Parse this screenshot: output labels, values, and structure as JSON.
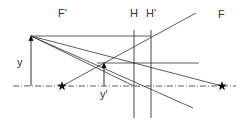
{
  "diagram": {
    "labels": {
      "focal_front": "F'",
      "principal_plane_h": "H",
      "principal_plane_h_prime": "H'",
      "focal_back": "F",
      "object_height": "y",
      "image_height": "y'"
    },
    "colors": {
      "line": "#333333",
      "background": "#ffffff"
    }
  }
}
